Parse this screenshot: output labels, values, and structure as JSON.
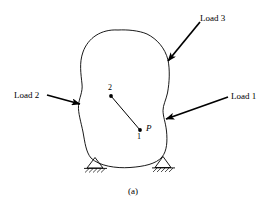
{
  "figure": {
    "caption": "(a)",
    "stroke_color": "#000000",
    "background_color": "#ffffff"
  },
  "labels": {
    "load_1": "Load 1",
    "load_2": "Load 2",
    "load_3": "Load 3",
    "node_1": "1",
    "node_2": "2",
    "point_p": "P"
  },
  "geometry": {
    "body_outline_path": "M 118 30 C 101 29 88 38 83 52 C 79 63 81 74 82 84 C 83 93 80 99 79 106 C 78 113 81 122 83 132 C 85 143 86 152 91 158 C 99 166 116 168 130 167 C 144 166 156 164 162 157 C 167 151 167 141 166 131 C 165 122 163 116 163 110 C 163 105 166 100 167 93 C 169 82 170 70 168 60 C 165 48 157 39 147 34 C 139 31 127 30 118 30 Z",
    "arrows": [
      {
        "name": "load-3-arrow",
        "from": [
          200,
          22
        ],
        "to": [
          167,
          62
        ],
        "points_to": "body upper-right edge"
      },
      {
        "name": "load-2-arrow",
        "from": [
          48,
          96
        ],
        "to": [
          82,
          105
        ],
        "points_to": "body left notch"
      },
      {
        "name": "load-1-arrow",
        "from": [
          228,
          97
        ],
        "to": [
          165,
          119
        ],
        "points_to": "body right notch"
      }
    ],
    "segment_1_2": {
      "from": [
        111,
        96
      ],
      "to": [
        140,
        130
      ]
    },
    "nodes": [
      {
        "id": "2",
        "x": 111,
        "y": 96
      },
      {
        "id": "1",
        "x": 140,
        "y": 130
      }
    ],
    "supports": [
      {
        "name": "left-pin-support",
        "apex": [
          95,
          158
        ],
        "base_y": 168,
        "half_width": 9
      },
      {
        "name": "right-pin-support",
        "apex": [
          163,
          157
        ],
        "base_y": 168,
        "half_width": 9
      }
    ]
  }
}
